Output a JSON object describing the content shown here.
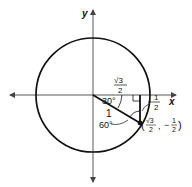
{
  "diagram": {
    "type": "unit-circle",
    "axes": {
      "x_label": "x",
      "y_label": "y"
    },
    "radius_label": "1",
    "angles": {
      "angle_30": "30°",
      "angle_60": "60°"
    },
    "legs": {
      "horizontal": {
        "numerator": "√3",
        "denominator": "2"
      },
      "vertical": {
        "sign": "",
        "numerator": "1",
        "denominator": "2"
      }
    },
    "point": {
      "open": "(",
      "x_numerator": "√3",
      "x_denominator": "2",
      "separator": ",",
      "y_sign": "−",
      "y_numerator": "1",
      "y_denominator": "2",
      "close": ")"
    },
    "colors": {
      "stroke": "#111111",
      "axis": "#444444",
      "background": "#ffffff"
    }
  }
}
